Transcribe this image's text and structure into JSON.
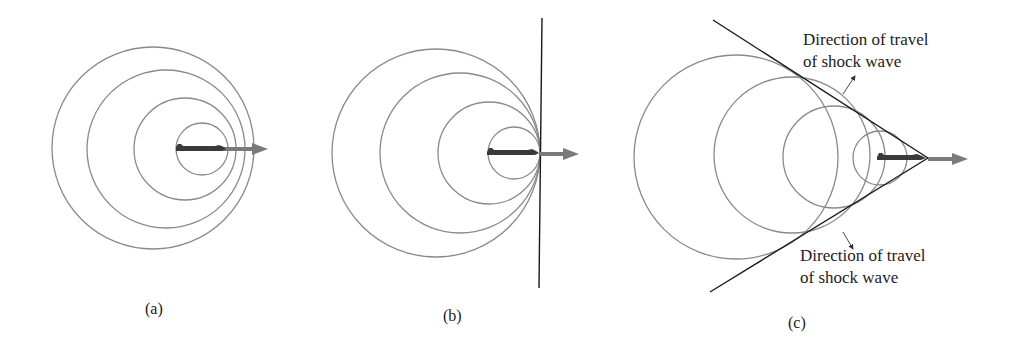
{
  "figure": {
    "panels": [
      {
        "id": "a",
        "label": "(a)",
        "description": "subsonic source"
      },
      {
        "id": "b",
        "label": "(b)",
        "description": "sonic source"
      },
      {
        "id": "c",
        "label": "(c)",
        "description": "supersonic source"
      }
    ],
    "annotations": {
      "upper_line1": "Direction of travel",
      "upper_line2": "of shock wave",
      "lower_line1": "Direction of travel",
      "lower_line2": "of shock wave"
    },
    "colors": {
      "wavefront": "#8a8a8a",
      "shock_line": "#1a1a1a",
      "velocity_arrow": "#7a7a7a",
      "plane": "#3a3a3a"
    }
  }
}
